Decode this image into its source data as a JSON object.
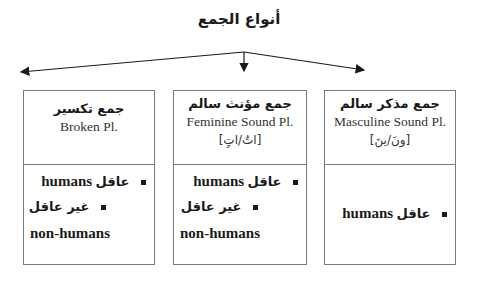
{
  "title": "أنواع الجمع",
  "boxes": [
    {
      "id": "broken",
      "heading_ar": "جمع تكسير",
      "heading_en": "Broken Pl.",
      "suffix": "",
      "items": [
        {
          "ar": "عاقل",
          "en": "humans"
        },
        {
          "ar": "غير عاقل",
          "en": "non-humans"
        }
      ]
    },
    {
      "id": "feminine",
      "heading_ar": "جمع مؤنث سالم",
      "heading_en": "Feminine Sound Pl.",
      "suffix": "[اتٌ/اتٍ]",
      "items": [
        {
          "ar": "عاقل",
          "en": "humans"
        },
        {
          "ar": "غير عاقل",
          "en": "non-humans"
        }
      ]
    },
    {
      "id": "masculine",
      "heading_ar": "جمع مذكر سالم",
      "heading_en": "Masculine Sound Pl.",
      "suffix": "[ونَ/ينَ]",
      "items": [
        {
          "ar": "عاقل",
          "en": "humans"
        }
      ]
    }
  ],
  "colors": {
    "border": "#7a7a7a",
    "text": "#1a1a1a"
  }
}
